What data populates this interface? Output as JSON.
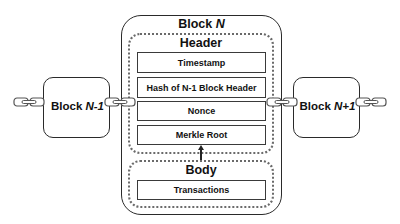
{
  "diagram": {
    "main_block": {
      "title_prefix": "Block ",
      "title_var": "N",
      "header": {
        "title": "Header",
        "fields": [
          {
            "label": "Timestamp"
          },
          {
            "label": "Hash of N-1 Block Header"
          },
          {
            "label": "Nonce"
          },
          {
            "label": "Merkle Root"
          }
        ]
      },
      "body": {
        "title": "Body",
        "fields": [
          {
            "label": "Transactions"
          }
        ]
      },
      "arrow": "Body → Merkle Root"
    },
    "previous_block": {
      "label_prefix": "Block ",
      "label_var": "N-1"
    },
    "next_block": {
      "label_prefix": "Block ",
      "label_var": "N+1"
    },
    "icons": {
      "chain_link": "chain-link-icon"
    },
    "colors": {
      "stroke": "#2a2a2a",
      "dotted": "#6a6a6a",
      "background": "#ffffff"
    }
  }
}
